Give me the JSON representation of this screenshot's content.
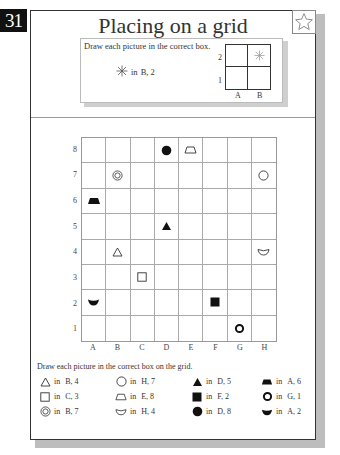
{
  "page_number": "31",
  "title": "Placing on a grid",
  "star_icon": "star-outline-icon",
  "example": {
    "instruction": "Draw each picture in the correct box.",
    "item": {
      "icon": "asterisk-star-icon",
      "connector": "in",
      "position": "B, 2"
    },
    "mini_grid": {
      "columns": [
        "A",
        "B"
      ],
      "rows": [
        "2",
        "1"
      ],
      "filled": {
        "col": "B",
        "row": "2",
        "icon": "asterisk-star-icon"
      }
    }
  },
  "grid": {
    "columns": [
      "A",
      "B",
      "C",
      "D",
      "E",
      "F",
      "G",
      "H"
    ],
    "rows": [
      "8",
      "7",
      "6",
      "5",
      "4",
      "3",
      "2",
      "1"
    ],
    "placed": [
      {
        "col": "D",
        "row": "8",
        "shape": "filled-circle"
      },
      {
        "col": "E",
        "row": "8",
        "shape": "outline-trapezoid"
      },
      {
        "col": "B",
        "row": "7",
        "shape": "double-circle"
      },
      {
        "col": "H",
        "row": "7",
        "shape": "outline-circle"
      },
      {
        "col": "A",
        "row": "6",
        "shape": "filled-trapezoid"
      },
      {
        "col": "D",
        "row": "5",
        "shape": "filled-triangle"
      },
      {
        "col": "B",
        "row": "4",
        "shape": "outline-triangle"
      },
      {
        "col": "H",
        "row": "4",
        "shape": "outline-bowl"
      },
      {
        "col": "C",
        "row": "3",
        "shape": "outline-square"
      },
      {
        "col": "A",
        "row": "2",
        "shape": "filled-bowl"
      },
      {
        "col": "F",
        "row": "2",
        "shape": "filled-square"
      },
      {
        "col": "G",
        "row": "1",
        "shape": "thick-ring"
      }
    ]
  },
  "instructions": "Draw each picture in the correct box on the grid.",
  "legend": [
    {
      "shape": "outline-triangle",
      "connector": "in",
      "position": "B, 4"
    },
    {
      "shape": "outline-circle",
      "connector": "in",
      "position": "H, 7"
    },
    {
      "shape": "filled-triangle",
      "connector": "in",
      "position": "D, 5"
    },
    {
      "shape": "filled-trapezoid",
      "connector": "in",
      "position": "A, 6"
    },
    {
      "shape": "outline-square",
      "connector": "in",
      "position": "C, 3"
    },
    {
      "shape": "outline-trapezoid",
      "connector": "in",
      "position": "E, 8"
    },
    {
      "shape": "filled-square",
      "connector": "in",
      "position": "F, 2"
    },
    {
      "shape": "thick-ring",
      "connector": "in",
      "position": "G, 1"
    },
    {
      "shape": "double-circle",
      "connector": "in",
      "position": "B, 7"
    },
    {
      "shape": "outline-bowl",
      "connector": "in",
      "position": "H, 4"
    },
    {
      "shape": "filled-circle",
      "connector": "in",
      "position": "D, 8"
    },
    {
      "shape": "filled-bowl",
      "connector": "in",
      "position": "A, 2"
    }
  ]
}
